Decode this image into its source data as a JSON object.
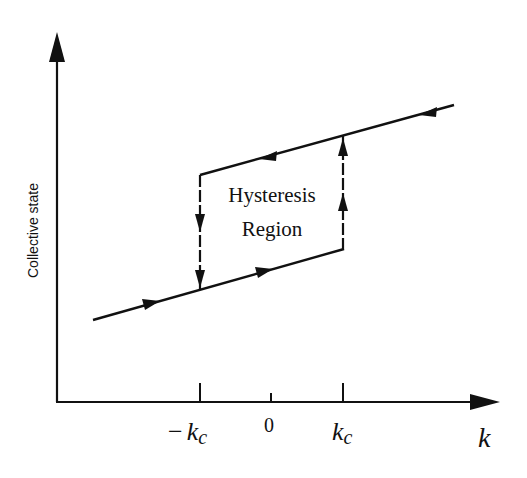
{
  "y_axis_label": "Collective state",
  "x_axis_label": "k",
  "ticks": [
    {
      "id": "neg-kc",
      "value": -1,
      "label_prefix": "−",
      "label_main": "k",
      "label_sub": "c"
    },
    {
      "id": "zero",
      "value": 0,
      "label_prefix": "",
      "label_main": "0",
      "label_sub": ""
    },
    {
      "id": "pos-kc",
      "value": 1,
      "label_prefix": "",
      "label_main": "k",
      "label_sub": "c"
    }
  ],
  "region_label_line1": "Hysteresis",
  "region_label_line2": "Region",
  "colors": {
    "ink": "#111111",
    "background": "#ffffff"
  },
  "curve": {
    "lower_branch": {
      "from_k": -2.0,
      "to_k": 1.0,
      "direction": "increasing"
    },
    "upper_branch": {
      "from_k": -1.0,
      "to_k": 2.55,
      "direction": "decreasing"
    },
    "jump_up_at": "k_c",
    "jump_down_at": "-k_c"
  }
}
